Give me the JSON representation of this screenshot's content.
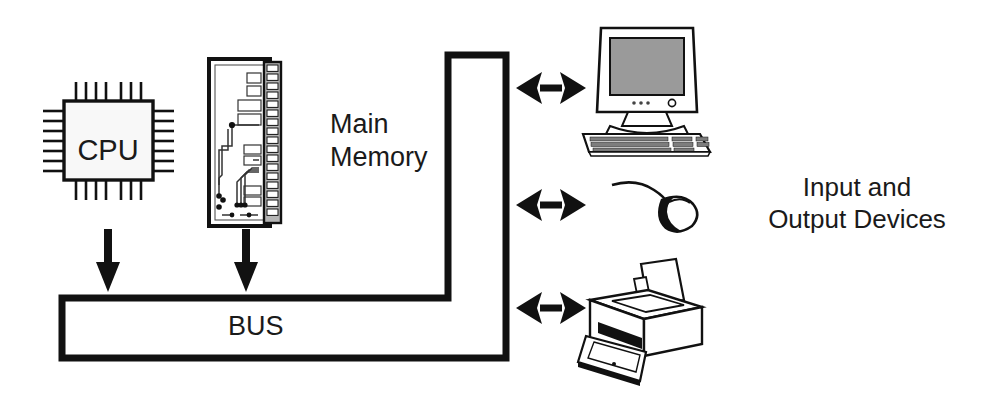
{
  "diagram": {
    "background_color": "#ffffff",
    "stroke_color": "#111111",
    "screen_fill": "#9a9a9a",
    "connector_fill": "#b5b5b5",
    "chip_fill": "#f7f7f7"
  },
  "labels": {
    "cpu": "CPU",
    "main_memory_line1": "Main",
    "main_memory_line2": "Memory",
    "bus": "BUS",
    "io_line1": "Input and",
    "io_line2": "Output Devices"
  },
  "components": [
    {
      "id": "cpu",
      "name": "CPU chip",
      "pins_per_side": 8
    },
    {
      "id": "main-memory",
      "name": "Main memory module",
      "connector_contacts": 18
    },
    {
      "id": "bus",
      "name": "System bus",
      "shape": "L-shaped"
    },
    {
      "id": "monitor",
      "name": "CRT monitor with keyboard"
    },
    {
      "id": "mouse",
      "name": "Computer mouse"
    },
    {
      "id": "printer",
      "name": "Inkjet printer"
    }
  ],
  "connections": [
    {
      "from": "cpu",
      "to": "bus",
      "type": "arrow-down"
    },
    {
      "from": "main-memory",
      "to": "bus",
      "type": "arrow-down"
    },
    {
      "from": "bus",
      "to": "monitor",
      "type": "double-arrow"
    },
    {
      "from": "bus",
      "to": "mouse",
      "type": "double-arrow"
    },
    {
      "from": "bus",
      "to": "printer",
      "type": "double-arrow"
    }
  ]
}
